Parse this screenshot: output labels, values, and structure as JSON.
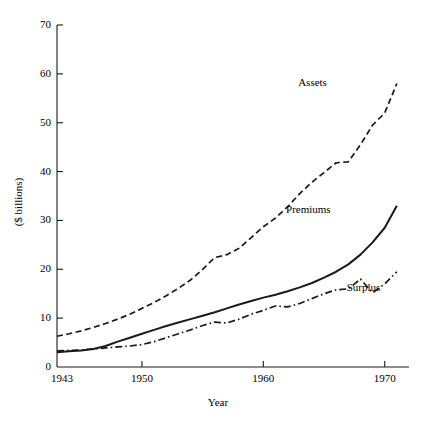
{
  "chart_data": {
    "type": "line",
    "title": "",
    "xlabel": "Year",
    "ylabel": "($ billions)",
    "xlim": [
      1943,
      1972
    ],
    "ylim": [
      0,
      70
    ],
    "xticks": [
      1943,
      1950,
      1960,
      1970
    ],
    "xticklabels": [
      "1943",
      "1950",
      "1960",
      "1970"
    ],
    "yticks": [
      0,
      10,
      20,
      30,
      40,
      50,
      60,
      70
    ],
    "yticklabels": [
      "0",
      "10",
      "20",
      "30",
      "40",
      "50",
      "60",
      "70"
    ],
    "grid": false,
    "legend_position": "inline-annotations",
    "x": [
      1943,
      1944,
      1945,
      1946,
      1947,
      1948,
      1949,
      1950,
      1951,
      1952,
      1953,
      1954,
      1955,
      1956,
      1957,
      1958,
      1959,
      1960,
      1961,
      1962,
      1963,
      1964,
      1965,
      1966,
      1967,
      1968,
      1969,
      1970,
      1971
    ],
    "series": [
      {
        "name": "Assets",
        "linestyle": "dashed",
        "color": "#1a1a1a",
        "values": [
          6.3,
          6.8,
          7.4,
          8.1,
          8.9,
          9.8,
          10.8,
          12.0,
          13.2,
          14.6,
          16.1,
          17.8,
          20.0,
          22.4,
          23.0,
          24.3,
          26.5,
          28.7,
          30.5,
          32.8,
          35.5,
          37.8,
          39.8,
          41.8,
          42.0,
          45.5,
          49.5,
          52.0,
          58.0
        ]
      },
      {
        "name": "Premiums",
        "linestyle": "solid",
        "color": "#1a1a1a",
        "values": [
          3.0,
          3.2,
          3.4,
          3.7,
          4.3,
          5.2,
          6.0,
          6.8,
          7.6,
          8.4,
          9.1,
          9.8,
          10.5,
          11.2,
          12.0,
          12.8,
          13.5,
          14.2,
          14.8,
          15.5,
          16.3,
          17.2,
          18.3,
          19.5,
          21.0,
          23.0,
          25.5,
          28.5,
          33.0
        ]
      },
      {
        "name": "Surplus",
        "linestyle": "dashdot",
        "color": "#1a1a1a",
        "values": [
          3.3,
          3.4,
          3.5,
          3.7,
          3.9,
          4.1,
          4.3,
          4.6,
          5.2,
          6.0,
          6.8,
          7.6,
          8.5,
          9.2,
          9.0,
          9.8,
          10.8,
          11.6,
          12.5,
          12.3,
          13.0,
          14.0,
          15.0,
          15.8,
          16.0,
          18.0,
          15.2,
          17.0,
          19.5
        ]
      }
    ],
    "annotations": [
      {
        "text": "Assets",
        "x": 1966,
        "y": 58
      },
      {
        "text": "Premiums",
        "x": 1965,
        "y": 32
      },
      {
        "text": "Surplus",
        "x": 1970,
        "y": 16
      }
    ]
  },
  "axes": {
    "ylabel": "($ billions)",
    "xlabel": "Year"
  }
}
